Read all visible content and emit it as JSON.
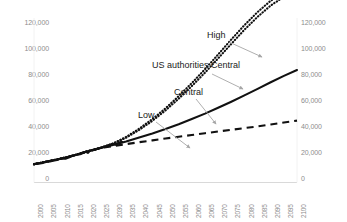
{
  "chart_data": {
    "type": "line",
    "title": "",
    "subtitle": "",
    "xlabel": "",
    "ylabel": "",
    "xlim": [
      2000,
      2100
    ],
    "ylim": [
      0,
      120000
    ],
    "grid": false,
    "legend_position": "none (inline annotations with leader arrows)",
    "y_axis_both_sides": true,
    "yticks": [
      0,
      20000,
      40000,
      60000,
      80000,
      100000,
      120000
    ],
    "ytick_labels": [
      "0",
      "20,000",
      "40,000",
      "60,000",
      "80,000",
      "100,000",
      "120,000"
    ],
    "xticks": [
      2000,
      2005,
      2010,
      2015,
      2020,
      2025,
      2030,
      2035,
      2040,
      2045,
      2050,
      2055,
      2060,
      2065,
      2070,
      2075,
      2080,
      2085,
      2090,
      2095,
      2100
    ],
    "xtick_labels": [
      "2000",
      "2005",
      "2010",
      "2015",
      "2020",
      "2025",
      "2030",
      "2035",
      "2040",
      "2045",
      "2050",
      "2055",
      "2060",
      "2065",
      "2070",
      "2075",
      "2080",
      "2085",
      "2090",
      "2095",
      "2100"
    ],
    "x": [
      2000,
      2005,
      2010,
      2015,
      2020,
      2025,
      2030,
      2035,
      2040,
      2045,
      2050,
      2055,
      2060,
      2065,
      2070,
      2075,
      2080,
      2085,
      2090,
      2095,
      2100
    ],
    "series": [
      {
        "name": "High",
        "style": "dotted",
        "color": "#111111",
        "values": [
          13000,
          15000,
          16300,
          17800,
          19600,
          21200,
          23300,
          26400,
          30200,
          34600,
          39600,
          45200,
          51200,
          57600,
          64400,
          71300,
          77900,
          84000,
          89200,
          93000,
          95500
        ]
      },
      {
        "name": "US authorities Central",
        "style": "dotted",
        "color": "#111111",
        "values": [
          13000,
          15000,
          16300,
          17800,
          19600,
          21200,
          23200,
          26000,
          29600,
          33800,
          38600,
          44000,
          49800,
          56000,
          62600,
          69300,
          75800,
          81800,
          87000,
          91000,
          93800
        ]
      },
      {
        "name": "Central",
        "style": "solid",
        "color": "#111111",
        "values": [
          13000,
          15000,
          16300,
          17800,
          19600,
          21200,
          22600,
          24200,
          26000,
          27900,
          30000,
          32200,
          34600,
          37100,
          39800,
          42600,
          45500,
          48500,
          51600,
          54500,
          57200
        ]
      },
      {
        "name": "Low",
        "style": "dashed",
        "color": "#111111",
        "values": [
          13000,
          15000,
          16300,
          17800,
          19600,
          21200,
          22100,
          23000,
          23900,
          24700,
          25600,
          26400,
          27200,
          28000,
          28800,
          29600,
          30400,
          31200,
          32100,
          33000,
          33900
        ]
      }
    ],
    "annotations": [
      {
        "label": "High",
        "points_to": "High"
      },
      {
        "label": "US authorities Central",
        "points_to": "US authorities Central"
      },
      {
        "label": "Central",
        "points_to": "Central"
      },
      {
        "label": "Low",
        "points_to": "Low"
      }
    ]
  },
  "colors": {
    "line": "#111111",
    "axis": "#d9d9d9",
    "tick_text": "#8d8d8d",
    "annotation_text": "#1a1a1a",
    "leader": "#a6a6a6"
  }
}
